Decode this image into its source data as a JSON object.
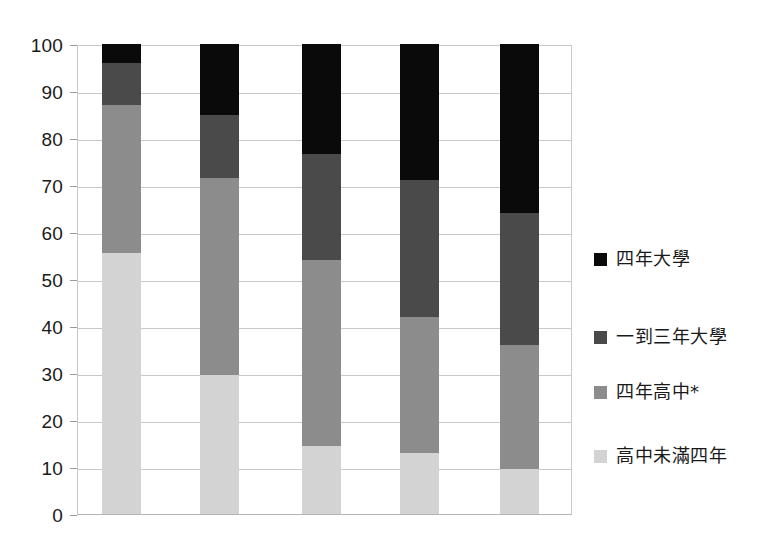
{
  "chart_data": {
    "type": "bar",
    "subtype": "stacked-bar-100-percent",
    "title": "",
    "subtitle": "",
    "xlabel": "",
    "ylabel": "",
    "categories": [
      "",
      "",
      "",
      "",
      ""
    ],
    "ylim": [
      0,
      100
    ],
    "ytick_values": [
      0,
      10,
      20,
      30,
      40,
      50,
      60,
      70,
      80,
      90,
      100
    ],
    "ytick_labels": [
      "0",
      "10",
      "20",
      "30",
      "40",
      "50",
      "60",
      "70",
      "80",
      "90",
      "100"
    ],
    "grid": true,
    "grid_axis": "y",
    "legend_position": "right",
    "series": [
      {
        "name": "高中未滿四年",
        "color": "#d3d3d3",
        "values": [
          55.5,
          29.5,
          14.5,
          13.0,
          9.5
        ]
      },
      {
        "name": "四年高中*",
        "color": "#8c8c8c",
        "values": [
          31.5,
          42.0,
          39.5,
          29.0,
          26.5
        ]
      },
      {
        "name": "一到三年大學",
        "color": "#4a4a4a",
        "values": [
          9.0,
          13.5,
          22.5,
          29.0,
          28.0
        ]
      },
      {
        "name": "四年大學",
        "color": "#0a0a0a",
        "values": [
          4.0,
          15.0,
          23.5,
          29.0,
          36.0
        ]
      }
    ],
    "stack_tops": [
      [
        55.5,
        87.0,
        96.0,
        100.0
      ],
      [
        29.5,
        71.5,
        85.0,
        100.0
      ],
      [
        14.5,
        54.0,
        76.5,
        100.0
      ],
      [
        13.0,
        42.0,
        71.0,
        100.0
      ],
      [
        9.5,
        36.0,
        64.0,
        100.0
      ]
    ]
  },
  "legend": {
    "items": [
      {
        "label": "四年大學",
        "color": "#0a0a0a"
      },
      {
        "label": "一到三年大學",
        "color": "#4a4a4a"
      },
      {
        "label": "四年高中*",
        "color": "#8c8c8c"
      },
      {
        "label": "高中未滿四年",
        "color": "#d3d3d3"
      }
    ]
  },
  "axis": {
    "y_labels": [
      "100",
      "90",
      "80",
      "70",
      "60",
      "50",
      "40",
      "30",
      "20",
      "10",
      "0"
    ]
  },
  "colors": {
    "four_year_college": "#0a0a0a",
    "one_to_three_year_college": "#4a4a4a",
    "four_year_highschool": "#8c8c8c",
    "less_than_four_year_highschool": "#d3d3d3",
    "gridline": "#c8c8c8",
    "text": "#1a1a1a",
    "background": "#ffffff"
  }
}
